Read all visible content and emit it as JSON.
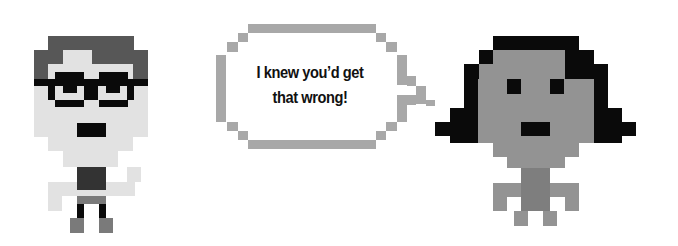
{
  "bubble": {
    "line1": "I knew you’d get",
    "line2": "that wrong!"
  },
  "colors": {
    "skin_light": "#e2e2e2",
    "hair_dark": "#575757",
    "black": "#0a0a0a",
    "shirt_dark": "#333333",
    "pants_gray": "#7a7a7a",
    "bubble_border": "#a8a8a8",
    "skin_mid": "#939393",
    "neck_mid": "#7e7e7e"
  },
  "characters": {
    "left_person": {
      "rects": [
        {
          "x": 48,
          "y": 36,
          "w": 86,
          "h": 14,
          "c": "hair_dark"
        },
        {
          "x": 34,
          "y": 50,
          "w": 114,
          "h": 14,
          "c": "hair_dark"
        },
        {
          "x": 34,
          "y": 64,
          "w": 114,
          "h": 15,
          "c": "hair_dark"
        },
        {
          "x": 63,
          "y": 50,
          "w": 29,
          "h": 14,
          "c": "skin_light"
        },
        {
          "x": 48,
          "y": 64,
          "w": 85,
          "h": 15,
          "c": "skin_light"
        },
        {
          "x": 34,
          "y": 79,
          "w": 114,
          "h": 58,
          "c": "skin_light"
        },
        {
          "x": 48,
          "y": 137,
          "w": 85,
          "h": 14,
          "c": "skin_light"
        },
        {
          "x": 63,
          "y": 151,
          "w": 55,
          "h": 16,
          "c": "skin_light"
        },
        {
          "x": 34,
          "y": 79,
          "w": 114,
          "h": 7,
          "c": "black"
        },
        {
          "x": 55,
          "y": 72,
          "w": 29,
          "h": 7,
          "c": "black"
        },
        {
          "x": 99,
          "y": 72,
          "w": 29,
          "h": 7,
          "c": "black"
        },
        {
          "x": 48,
          "y": 79,
          "w": 7,
          "h": 21,
          "c": "black"
        },
        {
          "x": 63,
          "y": 79,
          "w": 14,
          "h": 14,
          "c": "black"
        },
        {
          "x": 84,
          "y": 79,
          "w": 14,
          "h": 21,
          "c": "black"
        },
        {
          "x": 106,
          "y": 79,
          "w": 14,
          "h": 14,
          "c": "black"
        },
        {
          "x": 127,
          "y": 79,
          "w": 7,
          "h": 21,
          "c": "black"
        },
        {
          "x": 55,
          "y": 100,
          "w": 29,
          "h": 7,
          "c": "black"
        },
        {
          "x": 99,
          "y": 100,
          "w": 29,
          "h": 7,
          "c": "black"
        },
        {
          "x": 77,
          "y": 123,
          "w": 29,
          "h": 14,
          "c": "black"
        },
        {
          "x": 77,
          "y": 167,
          "w": 29,
          "h": 23,
          "c": "shirt_dark"
        },
        {
          "x": 48,
          "y": 182,
          "w": 29,
          "h": 14,
          "c": "skin_light"
        },
        {
          "x": 106,
          "y": 182,
          "w": 29,
          "h": 14,
          "c": "skin_light"
        },
        {
          "x": 127,
          "y": 167,
          "w": 14,
          "h": 15,
          "c": "skin_light"
        },
        {
          "x": 48,
          "y": 196,
          "w": 14,
          "h": 15,
          "c": "skin_light"
        },
        {
          "x": 77,
          "y": 190,
          "w": 29,
          "h": 6,
          "c": "skin_light"
        },
        {
          "x": 77,
          "y": 196,
          "w": 29,
          "h": 8,
          "c": "pants_gray"
        },
        {
          "x": 77,
          "y": 204,
          "w": 7,
          "h": 14,
          "c": "black"
        },
        {
          "x": 99,
          "y": 204,
          "w": 7,
          "h": 14,
          "c": "black"
        },
        {
          "x": 70,
          "y": 218,
          "w": 14,
          "h": 15,
          "c": "pants_gray"
        },
        {
          "x": 99,
          "y": 218,
          "w": 14,
          "h": 15,
          "c": "pants_gray"
        }
      ]
    },
    "right_person": {
      "rects": [
        {
          "x": 493,
          "y": 36,
          "w": 86,
          "h": 14,
          "c": "black"
        },
        {
          "x": 479,
          "y": 50,
          "w": 14,
          "h": 14,
          "c": "black"
        },
        {
          "x": 565,
          "y": 50,
          "w": 29,
          "h": 14,
          "c": "black"
        },
        {
          "x": 464,
          "y": 64,
          "w": 29,
          "h": 15,
          "c": "black"
        },
        {
          "x": 565,
          "y": 64,
          "w": 43,
          "h": 15,
          "c": "black"
        },
        {
          "x": 464,
          "y": 79,
          "w": 14,
          "h": 50,
          "c": "black"
        },
        {
          "x": 594,
          "y": 79,
          "w": 14,
          "h": 50,
          "c": "black"
        },
        {
          "x": 450,
          "y": 108,
          "w": 28,
          "h": 35,
          "c": "black"
        },
        {
          "x": 594,
          "y": 108,
          "w": 28,
          "h": 35,
          "c": "black"
        },
        {
          "x": 435,
          "y": 122,
          "w": 15,
          "h": 14,
          "c": "black"
        },
        {
          "x": 622,
          "y": 122,
          "w": 14,
          "h": 14,
          "c": "black"
        },
        {
          "x": 493,
          "y": 50,
          "w": 72,
          "h": 14,
          "c": "skin_mid"
        },
        {
          "x": 479,
          "y": 64,
          "w": 86,
          "h": 15,
          "c": "skin_mid"
        },
        {
          "x": 478,
          "y": 79,
          "w": 116,
          "h": 64,
          "c": "skin_mid"
        },
        {
          "x": 493,
          "y": 143,
          "w": 86,
          "h": 14,
          "c": "skin_mid"
        },
        {
          "x": 507,
          "y": 157,
          "w": 58,
          "h": 11,
          "c": "skin_mid"
        },
        {
          "x": 507,
          "y": 79,
          "w": 14,
          "h": 15,
          "c": "black"
        },
        {
          "x": 550,
          "y": 79,
          "w": 14,
          "h": 15,
          "c": "black"
        },
        {
          "x": 521,
          "y": 122,
          "w": 29,
          "h": 14,
          "c": "black"
        },
        {
          "x": 521,
          "y": 168,
          "w": 29,
          "h": 43,
          "c": "neck_mid"
        },
        {
          "x": 493,
          "y": 183,
          "w": 28,
          "h": 14,
          "c": "skin_mid"
        },
        {
          "x": 550,
          "y": 183,
          "w": 29,
          "h": 14,
          "c": "skin_mid"
        },
        {
          "x": 493,
          "y": 197,
          "w": 14,
          "h": 14,
          "c": "skin_mid"
        },
        {
          "x": 565,
          "y": 197,
          "w": 14,
          "h": 14,
          "c": "skin_mid"
        },
        {
          "x": 514,
          "y": 211,
          "w": 14,
          "h": 15,
          "c": "skin_mid"
        },
        {
          "x": 543,
          "y": 211,
          "w": 14,
          "h": 15,
          "c": "skin_mid"
        }
      ]
    }
  },
  "speech_bubble": {
    "rects": [
      {
        "x": 248,
        "y": 24,
        "w": 128,
        "h": 9,
        "c": "bubble_border"
      },
      {
        "x": 238,
        "y": 33,
        "w": 10,
        "h": 9,
        "c": "bubble_border"
      },
      {
        "x": 227,
        "y": 42,
        "w": 11,
        "h": 10,
        "c": "bubble_border"
      },
      {
        "x": 216,
        "y": 55,
        "w": 10,
        "h": 67,
        "c": "bubble_border"
      },
      {
        "x": 227,
        "y": 122,
        "w": 11,
        "h": 9,
        "c": "bubble_border"
      },
      {
        "x": 238,
        "y": 131,
        "w": 10,
        "h": 9,
        "c": "bubble_border"
      },
      {
        "x": 248,
        "y": 140,
        "w": 128,
        "h": 9,
        "c": "bubble_border"
      },
      {
        "x": 376,
        "y": 33,
        "w": 10,
        "h": 9,
        "c": "bubble_border"
      },
      {
        "x": 386,
        "y": 42,
        "w": 11,
        "h": 10,
        "c": "bubble_border"
      },
      {
        "x": 397,
        "y": 55,
        "w": 10,
        "h": 30,
        "c": "bubble_border"
      },
      {
        "x": 407,
        "y": 76,
        "w": 9,
        "h": 10,
        "c": "bubble_border"
      },
      {
        "x": 416,
        "y": 86,
        "w": 10,
        "h": 18,
        "c": "bubble_border"
      },
      {
        "x": 426,
        "y": 100,
        "w": 9,
        "h": 6,
        "c": "bubble_border"
      },
      {
        "x": 407,
        "y": 95,
        "w": 9,
        "h": 10,
        "c": "bubble_border"
      },
      {
        "x": 397,
        "y": 95,
        "w": 10,
        "h": 27,
        "c": "bubble_border"
      },
      {
        "x": 386,
        "y": 122,
        "w": 11,
        "h": 9,
        "c": "bubble_border"
      },
      {
        "x": 376,
        "y": 131,
        "w": 10,
        "h": 9,
        "c": "bubble_border"
      }
    ]
  }
}
